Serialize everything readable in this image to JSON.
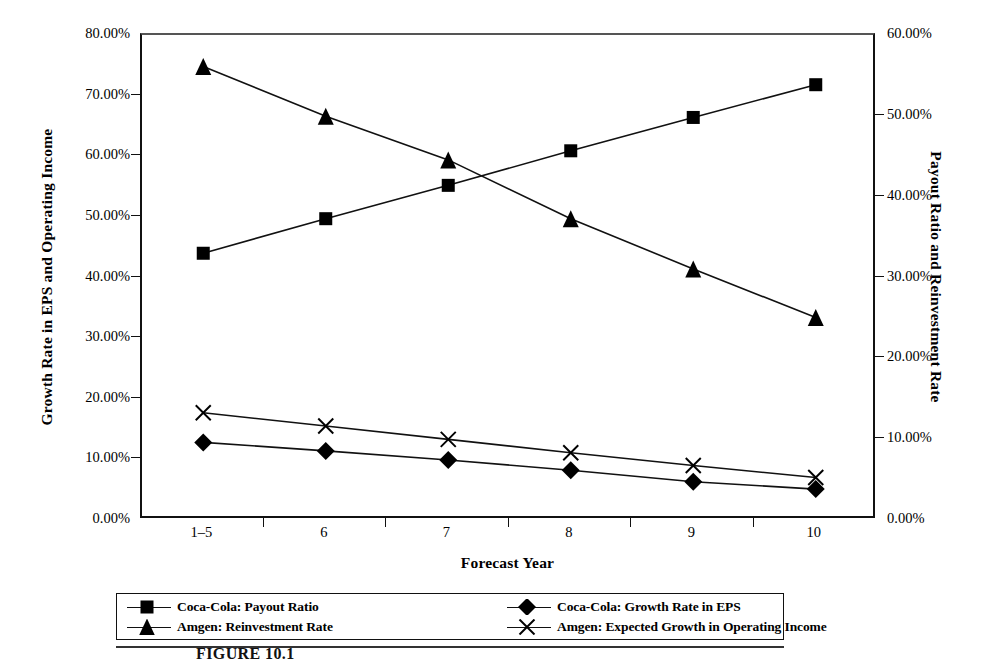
{
  "chart_data": {
    "type": "line",
    "title": "",
    "xlabel": "Forecast Year",
    "ylabel": "Growth Rate in EPS and Operating Income",
    "y2label": "Payout Ratio and Reinvestment Rate",
    "categories": [
      "1–5",
      "6",
      "7",
      "8",
      "9",
      "10"
    ],
    "ylim": [
      0,
      80
    ],
    "y2lim": [
      0,
      60
    ],
    "yticks": [
      "0.00%",
      "10.00%",
      "20.00%",
      "30.00%",
      "40.00%",
      "50.00%",
      "60.00%",
      "70.00%",
      "80.00%"
    ],
    "ytick_values": [
      0,
      10,
      20,
      30,
      40,
      50,
      60,
      70,
      80
    ],
    "y2ticks": [
      "0.00%",
      "10.00%",
      "20.00%",
      "30.00%",
      "40.00%",
      "50.00%",
      "60.00%"
    ],
    "y2tick_values": [
      0,
      10,
      20,
      30,
      40,
      50,
      60
    ],
    "grid": false,
    "legend_position": "bottom",
    "series": [
      {
        "name": "Coca-Cola: Payout Ratio",
        "marker": "square",
        "axis": "right",
        "values": [
          33.0,
          37.3,
          41.4,
          45.7,
          49.8,
          53.8
        ],
        "plotted_left_scale": [
          44.0,
          49.7,
          55.2,
          60.9,
          66.4,
          71.8
        ]
      },
      {
        "name": "Amgen: Reinvestment Rate",
        "marker": "triangle",
        "axis": "right",
        "values": [
          56.1,
          50.0,
          44.6,
          37.3,
          31.1,
          25.1
        ],
        "plotted_left_scale": [
          74.8,
          66.6,
          59.4,
          49.7,
          41.4,
          33.4
        ]
      },
      {
        "name": "Coca-Cola: Growth Rate in EPS",
        "marker": "diamond",
        "axis": "left",
        "values": [
          12.8,
          11.4,
          9.9,
          8.2,
          6.3,
          5.1
        ],
        "plotted_left_scale": [
          12.8,
          11.4,
          9.9,
          8.2,
          6.3,
          5.1
        ]
      },
      {
        "name": "Amgen: Expected Growth in Operating Income",
        "marker": "x",
        "axis": "left",
        "values": [
          17.7,
          15.5,
          13.3,
          11.1,
          9.0,
          7.0
        ],
        "plotted_left_scale": [
          17.7,
          15.5,
          13.3,
          11.1,
          9.0,
          7.0
        ]
      }
    ]
  },
  "figure": {
    "caption": "FIGURE 10.1",
    "line_color": "#111111",
    "marker_color": "#000000"
  }
}
